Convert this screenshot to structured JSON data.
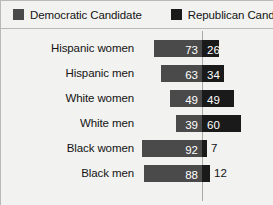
{
  "legend": {
    "democratic": {
      "label": "Democratic Candidate",
      "color": "#4a4a4a",
      "swatch": "square-swatch-icon"
    },
    "republican": {
      "label": "Republican Candidate",
      "color": "#1a1a1a",
      "swatch": "square-swatch-icon"
    }
  },
  "chart_data": {
    "type": "bar",
    "title": "",
    "subtitle": "",
    "xlabel": "",
    "ylabel": "",
    "orientation": "horizontal",
    "stacked": true,
    "grid": false,
    "legend_position": "top",
    "xlim": [
      0,
      100
    ],
    "axis_reference_line": 0,
    "value_suffix": "",
    "categories": [
      "Hispanic women",
      "Hispanic men",
      "White women",
      "White men",
      "Black women",
      "Black men"
    ],
    "series": [
      {
        "name": "Democratic Candidate",
        "color": "#4a4a4a",
        "values": [
          73,
          63,
          49,
          39,
          92,
          88
        ]
      },
      {
        "name": "Republican Candidate",
        "color": "#1a1a1a",
        "values": [
          26,
          34,
          49,
          60,
          7,
          12
        ]
      }
    ],
    "rows": [
      {
        "category": "Hispanic women",
        "democratic": 73,
        "republican": 26,
        "dem_label_inside": true,
        "rep_label_inside": true
      },
      {
        "category": "Hispanic men",
        "democratic": 63,
        "republican": 34,
        "dem_label_inside": true,
        "rep_label_inside": true
      },
      {
        "category": "White women",
        "democratic": 49,
        "republican": 49,
        "dem_label_inside": true,
        "rep_label_inside": true
      },
      {
        "category": "White men",
        "democratic": 39,
        "republican": 60,
        "dem_label_inside": true,
        "rep_label_inside": true
      },
      {
        "category": "Black women",
        "democratic": 92,
        "republican": 7,
        "dem_label_inside": true,
        "rep_label_inside": false
      },
      {
        "category": "Black men",
        "democratic": 88,
        "republican": 12,
        "dem_label_inside": true,
        "rep_label_inside": false
      }
    ]
  },
  "colors": {
    "background": "#f2f2f0",
    "democratic": "#4a4a4a",
    "republican": "#1a1a1a",
    "text": "#141414",
    "rule": "#b9b9b5",
    "center_line": "#a8a8a4"
  }
}
